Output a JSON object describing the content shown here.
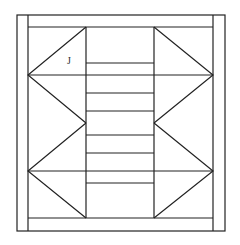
{
  "diagram": {
    "label": "J",
    "stroke_color": "#222222",
    "background": "#ffffff",
    "outer_frame": {
      "x1": 17,
      "y1": 15,
      "x2": 225,
      "y2": 231
    },
    "inner_frame": {
      "x1": 28,
      "y1": 27,
      "x2": 213,
      "y2": 218
    },
    "left_column": {
      "x1": 28,
      "x2": 85
    },
    "center_column": {
      "x1": 86,
      "x2": 154
    },
    "right_column": {
      "x1": 154,
      "x2": 213
    },
    "center_lines_y": [
      63,
      75,
      93,
      111,
      135,
      153,
      171,
      183
    ],
    "full_width_lines_y": [
      75,
      171
    ],
    "triangle_vertices": {
      "left_top": [
        [
          85,
          27
        ],
        [
          28,
          75
        ],
        [
          85,
          123
        ]
      ],
      "left_bottom": [
        [
          85,
          123
        ],
        [
          28,
          171
        ],
        [
          85,
          218
        ]
      ],
      "right_top": [
        [
          154,
          27
        ],
        [
          213,
          75
        ],
        [
          154,
          123
        ]
      ],
      "right_bottom": [
        [
          154,
          123
        ],
        [
          213,
          171
        ],
        [
          154,
          218
        ]
      ]
    }
  }
}
